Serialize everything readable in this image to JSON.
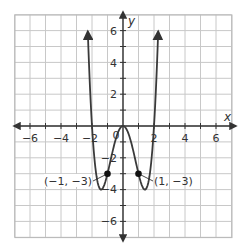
{
  "chart_data": {
    "type": "line",
    "title": "",
    "xlabel": "x",
    "ylabel": "y",
    "xlim": [
      -7,
      7
    ],
    "ylim": [
      -7,
      7
    ],
    "grid": true,
    "x_ticks": [
      -6,
      -4,
      -2,
      2,
      4,
      6
    ],
    "y_ticks": [
      6,
      4,
      2,
      -2,
      -4,
      -6
    ],
    "origin_label": "0",
    "series": [
      {
        "name": "f(x)",
        "function": "y = x^4 - 4x^2",
        "x": [
          -2.27,
          -2,
          -1.5,
          -1.414,
          -1,
          -0.5,
          0,
          0.5,
          1,
          1.414,
          1.5,
          2,
          2.27
        ],
        "values": [
          6.9,
          0,
          -3.94,
          -4,
          -3,
          -0.94,
          0,
          -0.94,
          -3,
          -4,
          -3.94,
          0,
          6.9
        ],
        "arrows_at_ends": true
      }
    ],
    "annotations": [
      {
        "x": -1,
        "y": -3,
        "label": "(−1, −3)"
      },
      {
        "x": 1,
        "y": -3,
        "label": "(1, −3)"
      }
    ]
  },
  "labels": {
    "x_axis": "x",
    "y_axis": "y",
    "origin": "0",
    "xt_m6": "−6",
    "xt_m4": "−4",
    "xt_m2": "−2",
    "xt_2": "2",
    "xt_4": "4",
    "xt_6": "6",
    "yt_6": "6",
    "yt_4": "4",
    "yt_2": "2",
    "yt_m2": "−2",
    "yt_m4": "−4",
    "yt_m6": "−6",
    "point_left": "(−1, −3)",
    "point_right": "(1, −3)"
  },
  "colors": {
    "grid": "#c8c8c8",
    "axis": "#333333",
    "curve": "#3a3a3a",
    "point": "#111111"
  }
}
